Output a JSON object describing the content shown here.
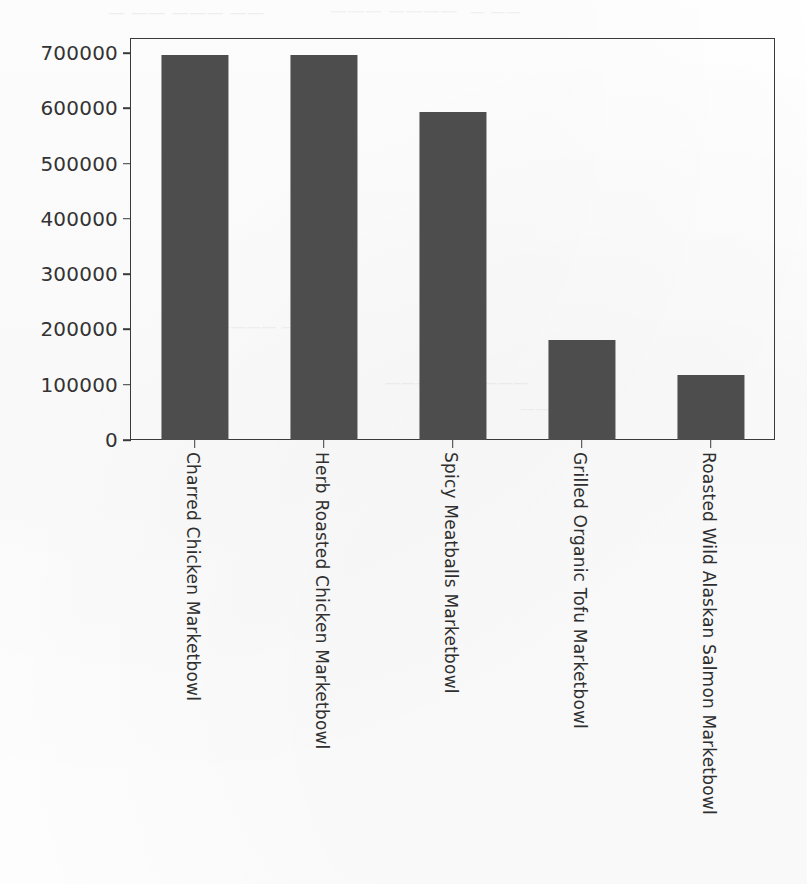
{
  "figure": {
    "background_color": "#fdfdfd",
    "bar_color": "#4d4d4d",
    "axis_color": "#3a3a3a",
    "scan_artifact_color": "#9aa3ad"
  },
  "chart_data": {
    "type": "bar",
    "title": "",
    "subtitle": "",
    "xlabel": "",
    "ylabel": "",
    "categories": [
      "Charred Chicken Marketbowl",
      "Herb Roasted Chicken Marketbowl",
      "Spicy Meatballs Marketbowl",
      "Grilled Organic Tofu Marketbowl",
      "Roasted Wild Alaskan Salmon Marketbowl"
    ],
    "values": [
      696000,
      697000,
      594000,
      181000,
      118000
    ],
    "ylim": [
      0,
      730000
    ],
    "yticks": [
      0,
      100000,
      200000,
      300000,
      400000,
      500000,
      600000,
      700000
    ],
    "ytick_labels": [
      "0",
      "100000",
      "200000",
      "300000",
      "400000",
      "500000",
      "600000",
      "700000"
    ],
    "xtick_label_rotation": 90,
    "grid": false,
    "legend": false,
    "legend_position": "none",
    "bar_width_fraction": 0.52
  },
  "scan_artifacts": {
    "note": "faint bleed-through ghost text from reverse side of scanned page",
    "fragments": [
      "— —— ———  ——",
      "———  ————",
      "— ——",
      "———— ——",
      "————— ————",
      "——— ——"
    ]
  },
  "accessibility": {
    "chart_description": "Vertical bar chart of five marketbowl menu items with values ranging from about 118000 to 697000."
  }
}
